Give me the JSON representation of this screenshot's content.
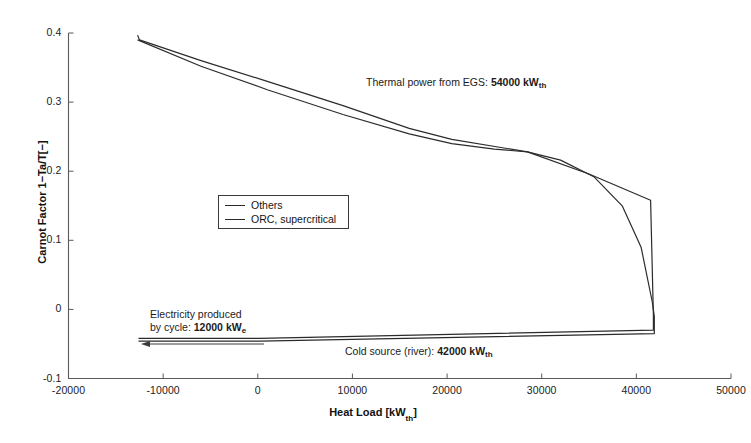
{
  "chart_data": {
    "type": "line",
    "title": "",
    "xlabel": "Heat Load [kWth]",
    "ylabel": "Carnot Factor 1−Ta/T[−]",
    "xlim": [
      -20000,
      50000
    ],
    "ylim": [
      -0.1,
      0.4
    ],
    "xticks": [
      "-20000",
      "-10000",
      "0",
      "10000",
      "20000",
      "30000",
      "40000",
      "50000"
    ],
    "xtick_values": [
      -20000,
      -10000,
      0,
      10000,
      20000,
      30000,
      40000,
      50000
    ],
    "yticks": [
      "0.4",
      "0.3",
      "0.2",
      "0.1",
      "0",
      "-0.1"
    ],
    "ytick_values": [
      0.4,
      0.3,
      0.2,
      0.1,
      0,
      -0.1
    ],
    "grid": false,
    "legend_position": "center-left",
    "legend": [
      "Others",
      "ORC, supercritical"
    ],
    "series": [
      {
        "name": "Others",
        "color": "#2b2b2b",
        "points": [
          [
            -12700,
            0.397
          ],
          [
            -12500,
            0.39
          ],
          [
            -6000,
            0.36
          ],
          [
            1000,
            0.33
          ],
          [
            9000,
            0.295
          ],
          [
            16000,
            0.262
          ],
          [
            20500,
            0.246
          ],
          [
            28500,
            0.228
          ],
          [
            35000,
            0.196
          ],
          [
            41500,
            0.158
          ],
          [
            41800,
            -0.01
          ],
          [
            41800,
            -0.03
          ],
          [
            200,
            -0.042
          ],
          [
            -12600,
            -0.042
          ]
        ]
      },
      {
        "name": "ORC, supercritical",
        "color": "#2b2b2b",
        "points": [
          [
            -12700,
            0.39
          ],
          [
            -6000,
            0.352
          ],
          [
            1000,
            0.318
          ],
          [
            9000,
            0.282
          ],
          [
            16000,
            0.254
          ],
          [
            20500,
            0.24
          ],
          [
            25000,
            0.232
          ],
          [
            28500,
            0.228
          ],
          [
            32000,
            0.216
          ],
          [
            35500,
            0.192
          ],
          [
            38500,
            0.15
          ],
          [
            40500,
            0.09
          ],
          [
            41700,
            0.01
          ],
          [
            41900,
            -0.01
          ],
          [
            41900,
            -0.035
          ],
          [
            200,
            -0.046
          ],
          [
            -12600,
            -0.046
          ]
        ]
      }
    ],
    "annotations": [
      {
        "name": "thermal-power-annotation",
        "text_prefix": "Thermal power from EGS: ",
        "value": "54000",
        "unit": "kW",
        "unit_sub": "th"
      },
      {
        "name": "electricity-annotation",
        "line1": "Electricity produced",
        "text_prefix": "by cycle: ",
        "value": "12000",
        "unit": "kW",
        "unit_sub": "e"
      },
      {
        "name": "cold-source-annotation",
        "text_prefix": "Cold source (river): ",
        "value": "42000",
        "unit": "kW",
        "unit_sub": "th"
      }
    ],
    "arrow": {
      "name": "electricity-arrow",
      "direction": "left",
      "from_x": 264,
      "to_x": 141,
      "y": 344
    }
  },
  "axis": {
    "x_title": "Heat Load [kW",
    "x_title_sub": "th",
    "x_title_end": "]",
    "y_title": "Carnot Factor 1−Ta/T[−]"
  },
  "legend": {
    "items": [
      {
        "label": "Others"
      },
      {
        "label": "ORC, supercritical"
      }
    ]
  },
  "colors": {
    "line": "#2b2b2b",
    "axis": "#4a4a4a",
    "text": "#1a1a1a",
    "background": "#ffffff"
  }
}
